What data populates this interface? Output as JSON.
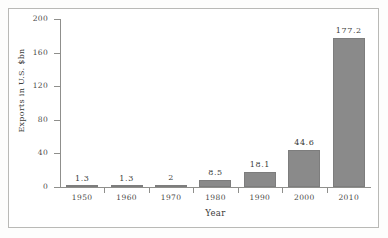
{
  "chart_data": {
    "type": "bar",
    "title": "",
    "xlabel": "Year",
    "ylabel": "Exports in U.S. $bn",
    "categories": [
      "1950",
      "1960",
      "1970",
      "1980",
      "1990",
      "2000",
      "2010"
    ],
    "values": [
      1.3,
      1.3,
      2,
      8.5,
      18.1,
      44.6,
      177.2
    ],
    "value_labels": [
      "1.3",
      "1.3",
      "2",
      "8.5",
      "18.1",
      "44.6",
      "177.2"
    ],
    "ylim": [
      0,
      200
    ],
    "yticks": [
      0,
      40,
      80,
      120,
      160,
      200
    ],
    "ytick_labels": [
      "0",
      "40",
      "80",
      "120",
      "160",
      "200"
    ],
    "grid": false,
    "legend": false,
    "bar_color": "#8a8a8a",
    "axis_color": "#8f8f8c",
    "frame_color": "#b9b9b6",
    "background": "#ffffff"
  }
}
